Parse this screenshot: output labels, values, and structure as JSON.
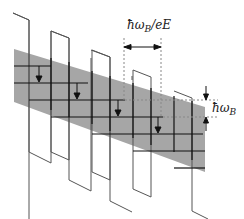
{
  "figure": {
    "type": "wannier-stark-ladder-diagram",
    "labels": {
      "period_label": "ħω",
      "period_sub": "B",
      "period_suffix": "/eE",
      "energy_label": "ħω",
      "energy_sub": "B"
    },
    "colors": {
      "band_fill": "#a6a6a6",
      "line": "#111111",
      "potential": "#555555",
      "dashed": "#888888"
    },
    "wells": 5,
    "arrows_down": 4
  }
}
